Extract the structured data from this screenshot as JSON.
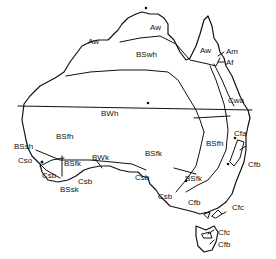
{
  "figure": {
    "type": "map",
    "colors": {
      "ink": "#111111",
      "background": "#ffffff"
    },
    "tropic_line": "Tropic of Capricorn (horizontal line)"
  },
  "labels": {
    "aw_west": "Aw",
    "aw_north": "Aw",
    "aw_cape": "Aw",
    "am": "Am",
    "af": "Af",
    "bswh": "BSwh",
    "bwh": "BWh",
    "cwa": "Cwa",
    "cfa": "Cfa",
    "bsfh_east": "BSfh",
    "cfb_east": "Cfb",
    "bsfk_central": "BSfk",
    "bsfk_southeast": "BSfk",
    "bsfk_west": "BSfk",
    "bsfh_west": "BSfh",
    "bssh": "BSsh",
    "cso": "Cso",
    "csb_sw": "Csb",
    "csb_sw2": "Csb",
    "bssk": "BSsk",
    "bwk": "BWk",
    "csb_sa": "Csb",
    "csb_sa2": "Csb",
    "cfb_victoria": "Cfb",
    "cfc_victoria": "Cfc",
    "cfc_tasmania": "Cfc",
    "cfb_tasmania": "Cfb"
  }
}
